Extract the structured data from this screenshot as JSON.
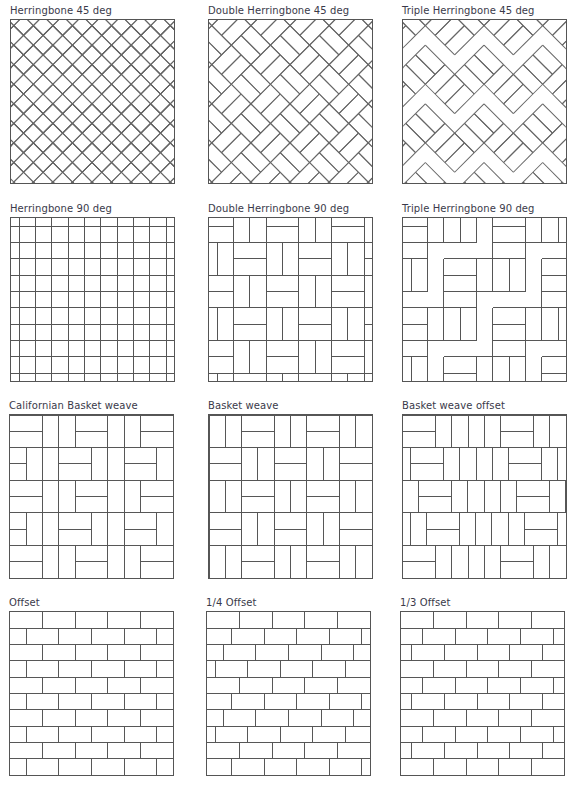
{
  "page": {
    "panels": [
      {
        "id": "herringbone-45",
        "label": "Herringbone 45 deg",
        "pattern": "herringbone",
        "angle": 45,
        "multiplicity": 1
      },
      {
        "id": "double-herringbone-45",
        "label": "Double Herringbone 45 deg",
        "pattern": "herringbone",
        "angle": 45,
        "multiplicity": 2
      },
      {
        "id": "triple-herringbone-45",
        "label": "Triple Herringbone 45 deg",
        "pattern": "herringbone",
        "angle": 45,
        "multiplicity": 3
      },
      {
        "id": "herringbone-90",
        "label": "Herringbone 90 deg",
        "pattern": "herringbone",
        "angle": 90,
        "multiplicity": 1
      },
      {
        "id": "double-herringbone-90",
        "label": "Double Herringbone 90 deg",
        "pattern": "herringbone",
        "angle": 90,
        "multiplicity": 2
      },
      {
        "id": "triple-herringbone-90",
        "label": "Triple Herringbone 90 deg",
        "pattern": "herringbone",
        "angle": 90,
        "multiplicity": 3
      },
      {
        "id": "californian-basket-weave",
        "label": "Californian Basket weave",
        "pattern": "californian-basket"
      },
      {
        "id": "basket-weave",
        "label": "Basket weave",
        "pattern": "basket"
      },
      {
        "id": "basket-weave-offset",
        "label": "Basket weave offset",
        "pattern": "basket-offset"
      },
      {
        "id": "offset",
        "label": "Offset",
        "pattern": "running-bond",
        "offset": "1/2"
      },
      {
        "id": "quarter-offset",
        "label": "1/4 Offset",
        "pattern": "running-bond",
        "offset": "1/4"
      },
      {
        "id": "third-offset",
        "label": "1/3 Offset",
        "pattern": "running-bond",
        "offset": "1/3"
      }
    ]
  },
  "colors": {
    "line": "#555555",
    "title_text": "#3a3a4a",
    "background": "#ffffff"
  }
}
